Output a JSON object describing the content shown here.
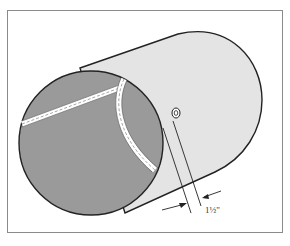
{
  "diagram": {
    "dimension_label": "1½\"",
    "colors": {
      "frame": "#8a8a8a",
      "body_fill": "#e4e4e4",
      "end_fill": "#9a9a9a",
      "outline": "#222222",
      "seam": "#ffffff"
    }
  }
}
